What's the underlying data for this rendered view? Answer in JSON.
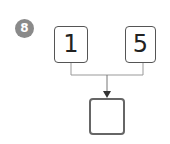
{
  "problem": {
    "number": "8",
    "operands": [
      "1",
      "5"
    ],
    "answer": ""
  },
  "colors": {
    "badge": "#8a8a8a",
    "box_border": "#555555",
    "connector": "#999999"
  }
}
